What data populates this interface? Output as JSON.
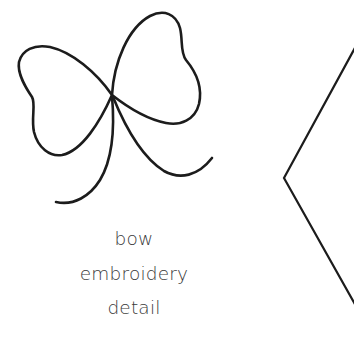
{
  "illustration": {
    "subject": "bow-icon",
    "stroke_color": "#1c1c1c"
  },
  "caption": {
    "lines": [
      "bow",
      "embroidery",
      "detail"
    ],
    "color": "#3a3a3a"
  },
  "navigation": {
    "chevron": "chevron-left-icon",
    "stroke_color": "#1c1c1c"
  }
}
